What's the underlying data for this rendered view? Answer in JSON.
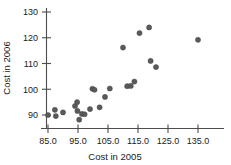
{
  "chart_data": {
    "type": "scatter",
    "title": "",
    "xlabel": "Cost in 2005",
    "ylabel": "Cost in 2006",
    "xlim": [
      83.0,
      137.5
    ],
    "ylim": [
      86.0,
      132.0
    ],
    "grid": false,
    "legend": "none",
    "xticks": [
      "85.0",
      "95.0",
      "105.0",
      "115.0",
      "125.0",
      "135.0"
    ],
    "xtick_values": [
      85.0,
      95.0,
      105.0,
      115.0,
      125.0,
      135.0
    ],
    "yticks": [
      "90",
      "100",
      "110",
      "120",
      "130"
    ],
    "ytick_values": [
      90,
      100,
      110,
      120,
      130
    ],
    "marker": "filled-circle",
    "marker_color": "#5a5a5a",
    "points": [
      {
        "x": 85.0,
        "y": 90.0
      },
      {
        "x": 87.3,
        "y": 92.0
      },
      {
        "x": 87.6,
        "y": 89.6
      },
      {
        "x": 90.0,
        "y": 91.0
      },
      {
        "x": 94.0,
        "y": 93.5
      },
      {
        "x": 94.7,
        "y": 95.0
      },
      {
        "x": 94.8,
        "y": 91.6
      },
      {
        "x": 95.4,
        "y": 88.2
      },
      {
        "x": 96.3,
        "y": 90.4
      },
      {
        "x": 97.2,
        "y": 90.3
      },
      {
        "x": 99.0,
        "y": 92.3
      },
      {
        "x": 99.8,
        "y": 100.2
      },
      {
        "x": 100.5,
        "y": 99.8
      },
      {
        "x": 102.2,
        "y": 93.0
      },
      {
        "x": 104.0,
        "y": 97.0
      },
      {
        "x": 105.6,
        "y": 100.3
      },
      {
        "x": 110.0,
        "y": 116.2
      },
      {
        "x": 111.4,
        "y": 101.2
      },
      {
        "x": 112.6,
        "y": 101.3
      },
      {
        "x": 113.8,
        "y": 103.0
      },
      {
        "x": 115.5,
        "y": 121.8
      },
      {
        "x": 118.7,
        "y": 124.0
      },
      {
        "x": 119.2,
        "y": 111.0
      },
      {
        "x": 121.0,
        "y": 108.6
      },
      {
        "x": 135.0,
        "y": 119.2
      }
    ]
  }
}
